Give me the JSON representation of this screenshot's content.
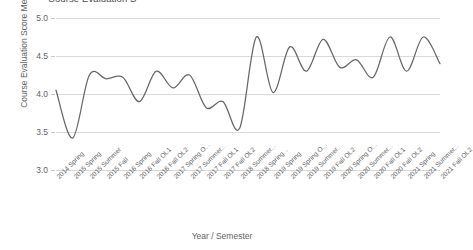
{
  "chart_data": {
    "type": "line",
    "xlabel": "Year / Semester",
    "ylabel": "Course Evaluation Score Mean",
    "ylim": [
      3.0,
      5.0
    ],
    "yticks": [
      "3.0",
      "3.5",
      "4.0",
      "4.5",
      "5.0"
    ],
    "ytick_values": [
      3.0,
      3.5,
      4.0,
      4.5,
      5.0
    ],
    "grid": "horizontal",
    "legend": "none",
    "line_color": "#666666",
    "categories": [
      "2014 Spring",
      "2015 Spring",
      "2015 Summer",
      "2015 Fall",
      "2016 Spring",
      "2016 Fall OL1",
      "2016 Fall OL2",
      "2017 Spring O...",
      "2017 Summer...",
      "2017 Fall OL1",
      "2017 Fall OL2",
      "2018 Summer...",
      "2018 Spring...",
      "2019 Spring",
      "2019 Spring O...",
      "2019 Summer...",
      "2019 Fall OL2",
      "2020 Spring O...",
      "2020 Summer...",
      "2020 Fall OL1",
      "2020 Fall OL2",
      "2021 Spring",
      "2021 Summer...",
      "2021 Fall OL2"
    ],
    "values": [
      4.05,
      3.42,
      4.25,
      4.2,
      4.22,
      3.9,
      4.3,
      4.08,
      4.25,
      3.82,
      3.9,
      3.55,
      4.75,
      4.02,
      4.62,
      4.3,
      4.72,
      4.35,
      4.45,
      4.22,
      4.75,
      4.3,
      4.75,
      4.4
    ],
    "series_name": "Course Evaluation Score Mean"
  },
  "axis": {
    "y_title": "Course Evaluation Score Mean",
    "x_title": "Year / Semester"
  },
  "title_text": "Course Evaluation S"
}
